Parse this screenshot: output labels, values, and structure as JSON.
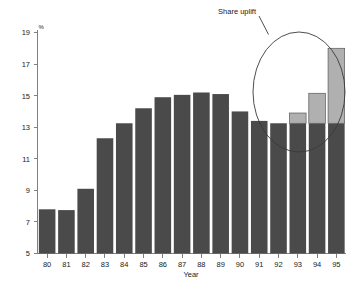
{
  "chart_data": {
    "type": "bar",
    "title": "",
    "subtitle": "",
    "xlabel": "Year",
    "ylabel": "%",
    "ylim": [
      5,
      19
    ],
    "yticks": [
      5,
      7,
      9,
      11,
      13,
      15,
      17,
      19
    ],
    "ytick_labels": [
      "5",
      "7",
      "9",
      "11",
      "13",
      "15",
      "17",
      "19"
    ],
    "grid": false,
    "legend": false,
    "legend_position": "none",
    "categories": [
      "80",
      "81",
      "82",
      "83",
      "84",
      "85",
      "86",
      "87",
      "88",
      "89",
      "90",
      "91",
      "92",
      "93",
      "94",
      "95"
    ],
    "series": [
      {
        "name": "Base share",
        "color": "#4a4a4a",
        "values": [
          7.8,
          7.75,
          9.1,
          12.3,
          13.25,
          14.2,
          14.9,
          15.05,
          15.2,
          15.1,
          14.0,
          13.4,
          13.25,
          13.25,
          13.25,
          13.25
        ]
      },
      {
        "name": "Share uplift",
        "color": "#b0b0b0",
        "values": [
          0,
          0,
          0,
          0,
          0,
          0,
          0,
          0,
          0,
          0,
          0,
          0,
          0,
          0.65,
          1.9,
          4.75
        ]
      }
    ],
    "totals": [
      7.8,
      7.75,
      9.1,
      12.3,
      13.25,
      14.2,
      14.9,
      15.05,
      15.2,
      15.1,
      14.0,
      13.4,
      13.25,
      13.9,
      15.15,
      18.0
    ],
    "annotations": [
      {
        "text": "Share uplift",
        "type": "callout-ellipse",
        "target_categories": [
          "93",
          "94",
          "95"
        ]
      }
    ]
  },
  "axes": {
    "y_unit_label": "%",
    "x_title": "Year",
    "y_tick_labels": [
      "19",
      "17",
      "15",
      "13",
      "11",
      "9",
      "7",
      "5"
    ],
    "x_tick_labels": [
      "80",
      "81",
      "82",
      "83",
      "84",
      "85",
      "86",
      "87",
      "88",
      "89",
      "90",
      "91",
      "92",
      "93",
      "94",
      "95"
    ]
  },
  "annotation": {
    "label": "Share uplift"
  },
  "colors": {
    "bar_base": "#4a4a4a",
    "bar_uplift": "#b0b0b0",
    "axis": "#808080",
    "callout": "#3a3a3a",
    "background": "#ffffff"
  }
}
